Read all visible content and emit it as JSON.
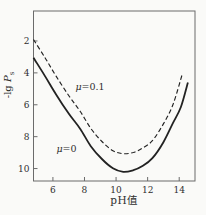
{
  "figure": {
    "background": "#fafaf8",
    "ink": "#222222",
    "frame_color": "#6b6b6b",
    "text_color": "#2e2e2e"
  },
  "chart_data": {
    "type": "line",
    "title": "",
    "xlabel": "pH值",
    "ylabel": "-lg Ps",
    "ylabel_parts": {
      "prefix": "-lg ",
      "symbol": "P",
      "subscript": "s"
    },
    "xlim": [
      4.77,
      15.0
    ],
    "ylim": [
      0.12,
      10.78
    ],
    "y_increases_downward": true,
    "grid": false,
    "x_ticks": [
      6,
      8,
      10,
      12,
      14
    ],
    "y_ticks": [
      2,
      4,
      6,
      8,
      10
    ],
    "series": [
      {
        "name": "mu-0.1",
        "label": "μ=0.1",
        "label_parts": {
          "symbol": "μ",
          "rest": "=0.1"
        },
        "line_style": "dashed",
        "label_anchor": {
          "pH": 8.35,
          "value": 4.82
        },
        "points": [
          [
            4.77,
            1.91
          ],
          [
            5.5,
            3.05
          ],
          [
            6.2,
            4.2
          ],
          [
            7.0,
            5.42
          ],
          [
            7.72,
            6.4
          ],
          [
            8.4,
            7.48
          ],
          [
            9.1,
            8.3
          ],
          [
            9.8,
            8.88
          ],
          [
            10.45,
            9.07
          ],
          [
            11.1,
            8.99
          ],
          [
            11.7,
            8.7
          ],
          [
            12.3,
            8.25
          ],
          [
            13.0,
            7.2
          ],
          [
            13.6,
            6.0
          ],
          [
            14.2,
            4.05
          ]
        ]
      },
      {
        "name": "mu-0",
        "label": "μ=0",
        "label_parts": {
          "symbol": "μ",
          "rest": "=0"
        },
        "line_style": "solid",
        "label_anchor": {
          "pH": 6.86,
          "value": 8.71
        },
        "points": [
          [
            4.77,
            3.05
          ],
          [
            5.5,
            4.2
          ],
          [
            6.2,
            5.35
          ],
          [
            7.0,
            6.55
          ],
          [
            7.72,
            7.5
          ],
          [
            8.4,
            8.6
          ],
          [
            9.1,
            9.4
          ],
          [
            9.8,
            9.98
          ],
          [
            10.45,
            10.2
          ],
          [
            11.1,
            10.1
          ],
          [
            11.7,
            9.83
          ],
          [
            12.3,
            9.35
          ],
          [
            13.0,
            8.35
          ],
          [
            13.6,
            7.15
          ],
          [
            14.1,
            6.15
          ],
          [
            14.55,
            4.6
          ]
        ]
      }
    ]
  }
}
